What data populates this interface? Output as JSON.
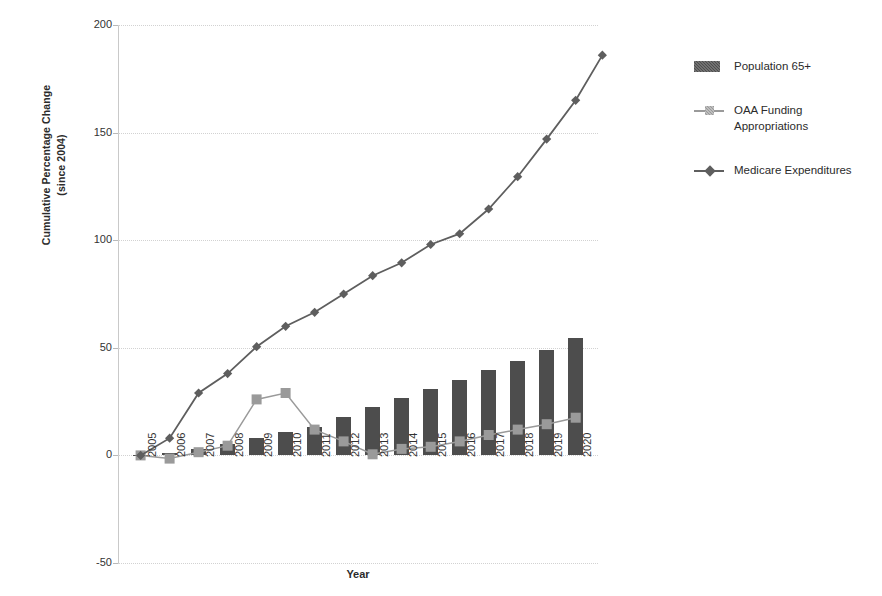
{
  "chart_data": {
    "type": "line",
    "title": "",
    "xlabel": "Year",
    "ylabel": "Cumulative Percentage Change (since 2004)",
    "ylabel_line1": "Cumulative Percentage Change",
    "ylabel_line2": "(since 2004)",
    "categories": [
      "2005",
      "2006",
      "2007",
      "2008",
      "2009",
      "2010",
      "2011",
      "2012",
      "2013",
      "2014",
      "2015",
      "2016",
      "2017",
      "2018",
      "2019",
      "2020"
    ],
    "yticks": [
      200,
      150,
      100,
      50,
      0,
      -50
    ],
    "ytick_labels": [
      "200",
      "150",
      "100",
      "50",
      "0",
      "-50"
    ],
    "ylim": [
      -50,
      200
    ],
    "grid": true,
    "legend_position": "right",
    "series": [
      {
        "name": "Population 65+",
        "type": "bar",
        "color": "#4d4d4d",
        "values": [
          0.3,
          1.0,
          3.0,
          5.5,
          8.0,
          11.0,
          13.0,
          18.0,
          22.5,
          26.5,
          31.0,
          35.0,
          39.5,
          44.0,
          49.0,
          54.5
        ]
      },
      {
        "name": "OAA Funding Appropriations",
        "type": "line",
        "marker": "square",
        "color": "#9a9a9a",
        "values": [
          0.0,
          -1.5,
          1.5,
          4.5,
          26.0,
          29.0,
          12.0,
          6.5,
          0.5,
          3.0,
          4.0,
          6.5,
          9.5,
          12.0,
          14.5,
          17.5
        ]
      },
      {
        "name": "Medicare Expenditures",
        "type": "line",
        "marker": "diamond",
        "color": "#5e5e5e",
        "values": [
          0.0,
          8.0,
          29.0,
          38.0,
          50.5,
          60.0,
          66.5,
          75.0,
          83.5,
          89.5,
          98.0,
          103.0,
          114.5,
          129.5,
          147.0,
          165.0
        ]
      }
    ],
    "final_point_value": 186.0
  },
  "legend": {
    "items": [
      {
        "label": "Population 65+",
        "marker": "bar-swatch"
      },
      {
        "label": "OAA Funding Appropriations",
        "label_line1": "OAA Funding",
        "label_line2": "Appropriations",
        "marker": "square-marker"
      },
      {
        "label": "Medicare Expenditures",
        "marker": "diamond-marker"
      }
    ]
  }
}
